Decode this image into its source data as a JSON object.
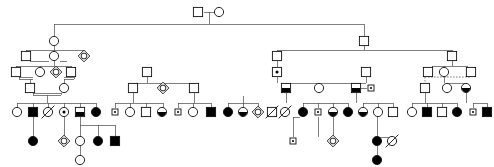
{
  "figure": {
    "kind": "pedigree-chart",
    "title": "",
    "width": 494,
    "height": 167,
    "background_color": "#ffffff",
    "line_color": "#4a4a4a",
    "symbol_stroke_color": "#111111",
    "affected_fill_color": "#000000",
    "unaffected_fill_color": "#ffffff",
    "generations": 5,
    "legend_present": false,
    "axis_labels_present": false,
    "text_labels_present": false
  },
  "chart_data": {
    "type": "pedigree",
    "title": "",
    "xlabel": "",
    "ylabel": "",
    "symbol_meanings": {
      "square": "male",
      "circle": "female",
      "diamond": "sex-unknown",
      "filled": "affected",
      "half-filled-bottom": "partially-affected-or-carrier",
      "open": "unaffected",
      "dot-center": "obligate-carrier",
      "diagonal-slash": "deceased",
      "small-square-with-dot": "carrier-male",
      "double-horizontal-line": "consanguineous-union",
      "dashed-line": "non-biological-or-adoptive-relation"
    },
    "generation_rows_y": [
      12,
      41,
      70,
      96,
      118,
      145,
      160
    ],
    "counts": {
      "generation_1": 2,
      "generation_2": 3,
      "generation_3": 12,
      "generation_4": 20,
      "generation_5": 39,
      "generation_6": 11,
      "generation_7": 1
    },
    "nodes": [
      {
        "id": "g1-m",
        "shape": "square",
        "state": "open",
        "x": 198,
        "y": 12,
        "gen": 1
      },
      {
        "id": "g1-f",
        "shape": "circle",
        "state": "open",
        "x": 219,
        "y": 12,
        "gen": 1
      },
      {
        "id": "g2-a",
        "shape": "circle",
        "state": "open",
        "x": 54,
        "y": 41,
        "gen": 2
      },
      {
        "id": "g2-b",
        "shape": "square",
        "state": "open",
        "x": 364,
        "y": 41,
        "gen": 2
      },
      {
        "id": "g3-a",
        "shape": "square",
        "state": "open",
        "x": 26,
        "y": 56,
        "gen": 3
      },
      {
        "id": "g3-b",
        "shape": "circle",
        "state": "open",
        "x": 54,
        "y": 56,
        "gen": 3
      },
      {
        "id": "g3-c",
        "shape": "diamond",
        "state": "dot",
        "x": 84,
        "y": 56,
        "gen": 3
      },
      {
        "id": "g3-d",
        "shape": "square",
        "state": "open",
        "x": 277,
        "y": 56,
        "gen": 3
      },
      {
        "id": "g3-e",
        "shape": "square",
        "state": "open",
        "x": 452,
        "y": 56,
        "gen": 3
      },
      {
        "id": "g4-a",
        "shape": "square",
        "state": "open",
        "x": 16,
        "y": 72,
        "gen": 4
      },
      {
        "id": "g4-b",
        "shape": "circle",
        "state": "open",
        "x": 40,
        "y": 72,
        "gen": 4
      },
      {
        "id": "g4-c",
        "shape": "diamond",
        "state": "dot",
        "x": 56,
        "y": 72,
        "gen": 4
      },
      {
        "id": "g4-d",
        "shape": "square",
        "state": "open",
        "x": 71,
        "y": 72,
        "gen": 4
      },
      {
        "id": "g4-e",
        "shape": "square",
        "state": "open",
        "x": 147,
        "y": 72,
        "gen": 4
      },
      {
        "id": "g4-f",
        "shape": "square",
        "state": "carrier-dot",
        "x": 277,
        "y": 72,
        "gen": 4
      },
      {
        "id": "g4-g",
        "shape": "square",
        "state": "open",
        "x": 366,
        "y": 72,
        "gen": 4
      },
      {
        "id": "g4-h",
        "shape": "square",
        "state": "open",
        "x": 428,
        "y": 72,
        "gen": 4
      },
      {
        "id": "g4-i",
        "shape": "circle",
        "state": "open",
        "x": 444,
        "y": 72,
        "gen": 4
      },
      {
        "id": "g4-j",
        "shape": "square",
        "state": "open",
        "x": 471,
        "y": 72,
        "gen": 4
      },
      {
        "id": "g5-a",
        "shape": "square",
        "state": "open",
        "x": 30,
        "y": 88,
        "gen": 5
      },
      {
        "id": "g5-b",
        "shape": "circle",
        "state": "open",
        "x": 64,
        "y": 88,
        "gen": 5
      },
      {
        "id": "g5-c",
        "shape": "square",
        "state": "open",
        "x": 133,
        "y": 88,
        "gen": 5
      },
      {
        "id": "g5-d",
        "shape": "diamond",
        "state": "dot",
        "x": 163,
        "y": 88,
        "gen": 5
      },
      {
        "id": "g5-e",
        "shape": "square",
        "state": "open",
        "x": 194,
        "y": 88,
        "gen": 5
      },
      {
        "id": "g5-f",
        "shape": "square",
        "state": "half",
        "x": 286,
        "y": 88,
        "gen": 5
      },
      {
        "id": "g5-g",
        "shape": "circle",
        "state": "open",
        "x": 319,
        "y": 88,
        "gen": 5
      },
      {
        "id": "g5-h",
        "shape": "square",
        "state": "half",
        "x": 356,
        "y": 88,
        "gen": 5
      },
      {
        "id": "g5-i",
        "shape": "small-square",
        "state": "carrier-dot",
        "x": 371,
        "y": 88,
        "gen": 5
      },
      {
        "id": "g5-j",
        "shape": "square",
        "state": "open",
        "x": 425,
        "y": 88,
        "gen": 5
      },
      {
        "id": "g5-k",
        "shape": "circle",
        "state": "open",
        "x": 447,
        "y": 88,
        "gen": 5
      },
      {
        "id": "g5-l",
        "shape": "circle",
        "state": "half",
        "x": 466,
        "y": 88,
        "gen": 5
      },
      {
        "id": "g6-a",
        "shape": "circle",
        "state": "open",
        "x": 17,
        "y": 112,
        "gen": 6
      },
      {
        "id": "g6-b",
        "shape": "square",
        "state": "filled",
        "x": 33,
        "y": 112,
        "gen": 6
      },
      {
        "id": "g6-c",
        "shape": "circle",
        "state": "deceased",
        "x": 48,
        "y": 112,
        "gen": 6
      },
      {
        "id": "g6-d",
        "shape": "circle",
        "state": "dot",
        "x": 64,
        "y": 112,
        "gen": 6
      },
      {
        "id": "g6-e",
        "shape": "square",
        "state": "half",
        "x": 80,
        "y": 112,
        "gen": 6
      },
      {
        "id": "g6-f",
        "shape": "circle",
        "state": "filled",
        "x": 96,
        "y": 112,
        "gen": 6
      },
      {
        "id": "g6-g",
        "shape": "small-square",
        "state": "carrier-dot",
        "x": 115,
        "y": 112,
        "gen": 6
      },
      {
        "id": "g6-h",
        "shape": "circle",
        "state": "open",
        "x": 130,
        "y": 112,
        "gen": 6
      },
      {
        "id": "g6-i",
        "shape": "square",
        "state": "open",
        "x": 146,
        "y": 112,
        "gen": 6
      },
      {
        "id": "g6-j",
        "shape": "circle",
        "state": "half",
        "x": 162,
        "y": 112,
        "gen": 6
      },
      {
        "id": "g6-k",
        "shape": "small-square",
        "state": "carrier-dot",
        "x": 178,
        "y": 112,
        "gen": 6
      },
      {
        "id": "g6-l",
        "shape": "circle",
        "state": "open",
        "x": 193,
        "y": 112,
        "gen": 6
      },
      {
        "id": "g6-m",
        "shape": "square",
        "state": "filled",
        "x": 211,
        "y": 112,
        "gen": 6
      },
      {
        "id": "g6-n",
        "shape": "circle",
        "state": "filled",
        "x": 228,
        "y": 112,
        "gen": 6
      },
      {
        "id": "g6-o",
        "shape": "circle",
        "state": "half",
        "x": 243,
        "y": 112,
        "gen": 6
      },
      {
        "id": "g6-p",
        "shape": "diamond",
        "state": "dot",
        "x": 258,
        "y": 112,
        "gen": 6
      },
      {
        "id": "g6-q",
        "shape": "square",
        "state": "deceased",
        "x": 272,
        "y": 112,
        "gen": 6
      },
      {
        "id": "g6-r",
        "shape": "circle",
        "state": "deceased",
        "x": 285,
        "y": 112,
        "gen": 6
      },
      {
        "id": "g6-s",
        "shape": "circle",
        "state": "filled",
        "x": 303,
        "y": 112,
        "gen": 6
      },
      {
        "id": "g6-t",
        "shape": "small-square",
        "state": "carrier-dot",
        "x": 318,
        "y": 112,
        "gen": 6
      },
      {
        "id": "g6-u",
        "shape": "circle",
        "state": "half",
        "x": 333,
        "y": 112,
        "gen": 6
      },
      {
        "id": "g6-v",
        "shape": "circle",
        "state": "filled",
        "x": 348,
        "y": 112,
        "gen": 6
      },
      {
        "id": "g6-w",
        "shape": "circle",
        "state": "half",
        "x": 363,
        "y": 112,
        "gen": 6
      },
      {
        "id": "g6-x",
        "shape": "circle",
        "state": "open",
        "x": 378,
        "y": 112,
        "gen": 6
      },
      {
        "id": "g6-y",
        "shape": "square",
        "state": "open",
        "x": 393,
        "y": 112,
        "gen": 6
      },
      {
        "id": "g6-z",
        "shape": "circle",
        "state": "open",
        "x": 412,
        "y": 112,
        "gen": 6
      },
      {
        "id": "g6-aa",
        "shape": "square",
        "state": "filled",
        "x": 427,
        "y": 112,
        "gen": 6
      },
      {
        "id": "g6-ab",
        "shape": "square",
        "state": "open",
        "x": 442,
        "y": 112,
        "gen": 6
      },
      {
        "id": "g6-ac",
        "shape": "circle",
        "state": "filled",
        "x": 457,
        "y": 112,
        "gen": 6
      },
      {
        "id": "g6-ad",
        "shape": "small-square",
        "state": "carrier-dot",
        "x": 473,
        "y": 112,
        "gen": 6
      },
      {
        "id": "g6-ae",
        "shape": "square",
        "state": "filled",
        "x": 487,
        "y": 112,
        "gen": 6
      },
      {
        "id": "g7-a",
        "shape": "circle",
        "state": "filled",
        "x": 33,
        "y": 141,
        "gen": 7
      },
      {
        "id": "g7-b",
        "shape": "diamond",
        "state": "dot",
        "x": 64,
        "y": 141,
        "gen": 7
      },
      {
        "id": "g7-c",
        "shape": "circle",
        "state": "open",
        "x": 80,
        "y": 141,
        "gen": 7
      },
      {
        "id": "g7-d",
        "shape": "circle",
        "state": "filled",
        "x": 98,
        "y": 141,
        "gen": 7
      },
      {
        "id": "g7-e",
        "shape": "square",
        "state": "filled",
        "x": 115,
        "y": 141,
        "gen": 7
      },
      {
        "id": "g7-f",
        "shape": "small-square",
        "state": "carrier-dot",
        "x": 293,
        "y": 141,
        "gen": 7
      },
      {
        "id": "g7-g",
        "shape": "diamond",
        "state": "dot",
        "x": 333,
        "y": 141,
        "gen": 7
      },
      {
        "id": "g7-h",
        "shape": "circle",
        "state": "filled",
        "x": 377,
        "y": 141,
        "gen": 7
      },
      {
        "id": "g7-i",
        "shape": "circle",
        "state": "deceased",
        "x": 392,
        "y": 141,
        "gen": 7
      },
      {
        "id": "g8-a",
        "shape": "circle",
        "state": "open",
        "x": 80,
        "y": 160,
        "gen": 8
      },
      {
        "id": "g8-b",
        "shape": "circle",
        "state": "filled",
        "x": 377,
        "y": 160,
        "gen": 8
      }
    ]
  }
}
